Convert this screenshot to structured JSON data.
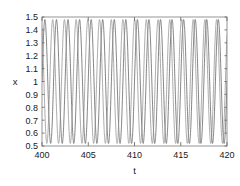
{
  "chart_data": {
    "type": "line",
    "title": "",
    "subtitle": "",
    "xlabel": "t",
    "ylabel": "x",
    "xlim": [
      400,
      420
    ],
    "ylim": [
      0.5,
      1.5
    ],
    "xticks": [
      400,
      405,
      410,
      415,
      420
    ],
    "xtick_labels": [
      "400",
      "405",
      "410",
      "415",
      "420"
    ],
    "yticks": [
      0.5,
      0.6,
      0.7,
      0.8,
      0.9,
      1.0,
      1.1,
      1.2,
      1.3,
      1.4,
      1.5
    ],
    "ytick_labels": [
      "0.5",
      "0.6",
      "0.7",
      "0.8",
      "0.9",
      "1",
      "1.1",
      "1.2",
      "1.3",
      "1.4",
      "1.5"
    ],
    "grid": false,
    "legend": null,
    "legend_position": "none",
    "annotations": [],
    "frame": "box-with-inward-ticks",
    "series": [
      {
        "name": "oscillator-1",
        "color": "#5a5a5a",
        "linewidth": 0.75,
        "waveform": "sinusoid",
        "center": 1.0,
        "amplitude": 0.48,
        "period": 1.25,
        "phase": 0.0
      },
      {
        "name": "oscillator-2",
        "color": "#8f8f8f",
        "linewidth": 0.75,
        "waveform": "sinusoid",
        "center": 1.0,
        "amplitude": 0.48,
        "period": 1.2658,
        "phase": 2.1
      }
    ],
    "n_cycles_series_1": 16,
    "n_cycles_series_2": 15.8,
    "value_min": 0.52,
    "value_max": 1.48
  },
  "axes_geometry": {
    "left": 42,
    "right": 227,
    "top": 17,
    "bottom": 146
  }
}
